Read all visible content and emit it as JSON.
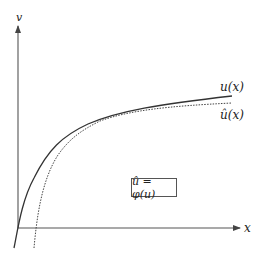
{
  "diagram": {
    "axes": {
      "y_label": "v",
      "x_label": "x"
    },
    "curves": [
      {
        "name": "u",
        "label": "u(x)",
        "style": "solid"
      },
      {
        "name": "u_hat",
        "label": "û(x)",
        "style": "dotted"
      }
    ],
    "relation_box": "û = φ(u)",
    "colors": {
      "line": "#333333",
      "background": "#ffffff"
    }
  }
}
